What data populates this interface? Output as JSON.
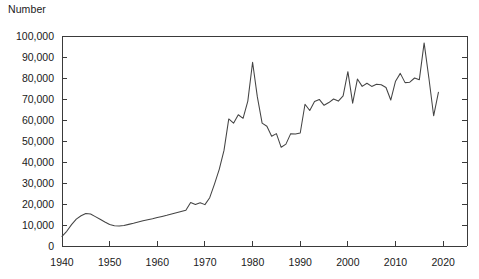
{
  "chart_data": {
    "type": "line",
    "title": "",
    "subtitle": "",
    "xlabel": "",
    "ylabel": "Number",
    "ylabel_position": "above-axis-top-left",
    "xlim": [
      1940,
      2025
    ],
    "ylim": [
      0,
      100000
    ],
    "grid": false,
    "legend": null,
    "legend_position": "none",
    "line_color": "#444444",
    "background_color": "#ffffff",
    "axis_color": "#3a3a3a",
    "y_ticks": [
      0,
      10000,
      20000,
      30000,
      40000,
      50000,
      60000,
      70000,
      80000,
      90000,
      100000
    ],
    "y_tick_labels": [
      "0",
      "10,000",
      "20,000",
      "30,000",
      "40,000",
      "50,000",
      "60,000",
      "70,000",
      "80,000",
      "90,000",
      "100,000"
    ],
    "x_ticks": [
      1940,
      1950,
      1960,
      1970,
      1980,
      1990,
      2000,
      2010,
      2020
    ],
    "x_tick_labels": [
      "1940",
      "1950",
      "1960",
      "1970",
      "1980",
      "1990",
      "2000",
      "2010",
      "2020"
    ],
    "series": [
      {
        "name": "Number",
        "x": [
          1940,
          1941,
          1942,
          1943,
          1944,
          1945,
          1946,
          1947,
          1948,
          1949,
          1950,
          1951,
          1952,
          1953,
          1954,
          1955,
          1956,
          1957,
          1958,
          1959,
          1960,
          1961,
          1962,
          1963,
          1964,
          1965,
          1966,
          1967,
          1968,
          1969,
          1970,
          1971,
          1972,
          1973,
          1974,
          1975,
          1976,
          1977,
          1978,
          1979,
          1980,
          1981,
          1982,
          1983,
          1984,
          1985,
          1986,
          1987,
          1988,
          1989,
          1990,
          1991,
          1992,
          1993,
          1994,
          1995,
          1996,
          1997,
          1998,
          1999,
          2000,
          2001,
          2002,
          2003,
          2004,
          2005,
          2006,
          2007,
          2008,
          2009,
          2010,
          2011,
          2012,
          2013,
          2014,
          2015,
          2016,
          2017,
          2018,
          2019
        ],
        "y": [
          4600,
          7000,
          10200,
          12800,
          14400,
          15500,
          15200,
          14000,
          12700,
          11400,
          10200,
          9600,
          9500,
          9800,
          10300,
          10800,
          11400,
          12000,
          12500,
          13000,
          13600,
          14100,
          14600,
          15200,
          15800,
          16400,
          17000,
          20700,
          19800,
          20600,
          19700,
          23000,
          29500,
          36500,
          45500,
          60500,
          58500,
          62500,
          60800,
          69000,
          87500,
          71000,
          58500,
          57000,
          52300,
          53500,
          47000,
          48500,
          53500,
          53300,
          53800,
          67500,
          64500,
          68800,
          69800,
          67000,
          68300,
          70000,
          69000,
          71500,
          83000,
          68000,
          79500,
          76000,
          77500,
          76000,
          77000,
          76800,
          75500,
          69500,
          78500,
          82200,
          77800,
          78000,
          80000,
          79200,
          96700,
          80000,
          62000,
          73200
        ]
      }
    ],
    "annotations": [
      {
        "label": "wartime peak",
        "x": 1945,
        "y": 15500
      },
      {
        "label": "postwar trough",
        "x": 1952,
        "y": 9500
      },
      {
        "label": "1980 peak",
        "x": 1980,
        "y": 87500
      },
      {
        "label": "mid-1980s trough",
        "x": 1986,
        "y": 47000
      },
      {
        "label": "record high",
        "x": 2016,
        "y": 96700
      },
      {
        "label": "sharp drop",
        "x": 2018,
        "y": 62000
      }
    ]
  }
}
